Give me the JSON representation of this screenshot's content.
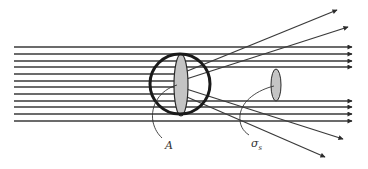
{
  "diagram": {
    "type": "scattering cross-section illustration",
    "colors": {
      "line": "#3a3a3a",
      "circle": "#1a1a1a",
      "fill": "#c4c4c4",
      "background": "#ffffff"
    },
    "incident_rays_y": [
      47,
      54,
      61,
      67,
      74,
      81,
      87,
      94,
      101,
      107,
      114,
      121
    ],
    "transmitted_rays_y": [
      47,
      54,
      61,
      67,
      101,
      107,
      114,
      121
    ],
    "scattered_rays": [
      {
        "from": [
          180,
          74
        ],
        "to": [
          337,
          10
        ]
      },
      {
        "from": [
          180,
          81
        ],
        "to": [
          348,
          27
        ]
      },
      {
        "from": [
          180,
          87
        ],
        "to": [
          343,
          139
        ]
      },
      {
        "from": [
          180,
          94
        ],
        "to": [
          325,
          157
        ]
      }
    ],
    "scatterer": {
      "cx": 180,
      "cy": 84,
      "r": 30
    },
    "geometric_cross_section": {
      "cx": 181,
      "cy": 85,
      "rx": 7,
      "ry": 31
    },
    "scattering_cross_section": {
      "cx": 276,
      "cy": 85,
      "rx": 5,
      "ry": 16
    },
    "labels": {
      "A": "A",
      "sigma_main": "σ",
      "sigma_sub": "s"
    }
  }
}
